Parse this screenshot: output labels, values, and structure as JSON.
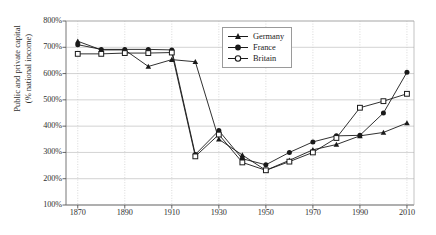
{
  "chart_data": {
    "type": "line",
    "title": "",
    "xlabel": "",
    "ylabel": "Public and private capital\n(% national income)",
    "x": [
      1870,
      1880,
      1890,
      1900,
      1910,
      1920,
      1930,
      1940,
      1950,
      1960,
      1970,
      1980,
      1990,
      2000,
      2010
    ],
    "xlim": [
      1865,
      2013
    ],
    "ylim": [
      100,
      800
    ],
    "xticks": [
      "1870",
      "1890",
      "1910",
      "1930",
      "1950",
      "1970",
      "1990",
      "2010"
    ],
    "xtick_values": [
      1870,
      1890,
      1910,
      1930,
      1950,
      1970,
      1990,
      2010
    ],
    "yticks": [
      "100%",
      "200%",
      "300%",
      "400%",
      "500%",
      "600%",
      "700%",
      "800%"
    ],
    "ytick_values": [
      100,
      200,
      300,
      400,
      500,
      600,
      700,
      800
    ],
    "grid": true,
    "legend_position": "top-right",
    "series": [
      {
        "name": "Germany",
        "marker": "filled-triangle",
        "color": "#1a1a1a",
        "values": [
          723,
          690,
          690,
          627,
          653,
          645,
          350,
          290,
          232,
          270,
          310,
          330,
          363,
          376,
          412
        ]
      },
      {
        "name": "France",
        "marker": "filled-circle",
        "color": "#1a1a1a",
        "values": [
          710,
          692,
          692,
          692,
          690,
          292,
          383,
          276,
          253,
          300,
          340,
          363,
          365,
          450,
          605
        ]
      },
      {
        "name": "Britain",
        "marker": "open-circle",
        "color": "#1a1a1a",
        "values": [
          675,
          675,
          678,
          678,
          680,
          285,
          368,
          262,
          232,
          265,
          300,
          355,
          470,
          495,
          523
        ]
      }
    ]
  },
  "legend": {
    "items": [
      {
        "label": "Germany",
        "marker": "filled-triangle"
      },
      {
        "label": "France",
        "marker": "filled-circle"
      },
      {
        "label": "Britain",
        "marker": "open-circle"
      }
    ]
  }
}
